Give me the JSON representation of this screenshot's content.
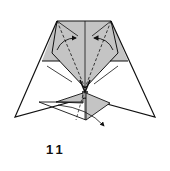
{
  "diagram": {
    "step_label": "11",
    "colors": {
      "paper_colored": "#c4c4c4",
      "paper_white": "#ffffff",
      "line": "#111111"
    },
    "annotations": [
      {
        "type": "valley-fold-arrow",
        "direction": "inward-left",
        "position": "top-left-flap"
      },
      {
        "type": "valley-fold-arrow",
        "direction": "inward-right",
        "position": "top-right-flap"
      },
      {
        "type": "fold-arrow",
        "direction": "down-right",
        "position": "bottom-flap"
      }
    ]
  }
}
